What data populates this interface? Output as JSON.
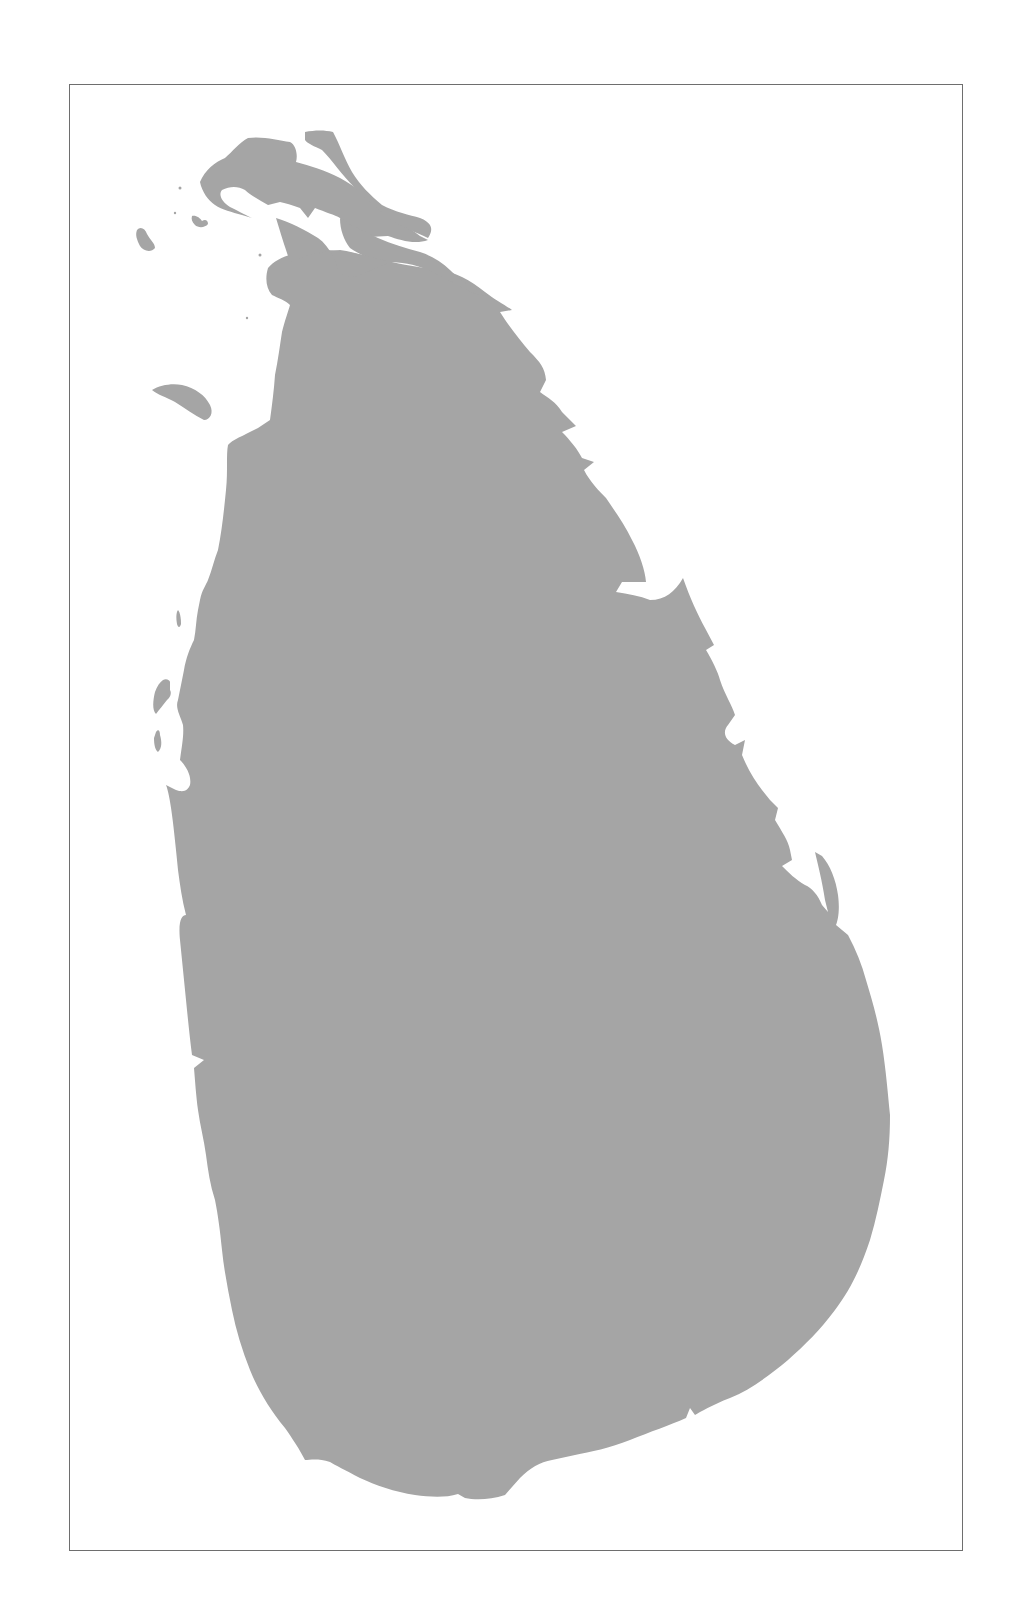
{
  "map": {
    "subject": "Sri Lanka",
    "style": "gray land silhouette on white, no labels",
    "land_color": "#a5a5a5",
    "water_color": "#ffffff",
    "frame_color": "#6e6e6e",
    "frame": {
      "left": 69,
      "top": 84,
      "right": 963,
      "bottom": 1551
    },
    "labels": []
  }
}
